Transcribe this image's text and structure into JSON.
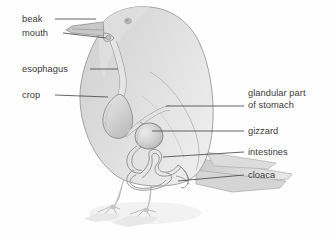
{
  "figure": {
    "colors": {
      "body_fill": "#d9d9d9",
      "body_fill_light": "#e4e4e4",
      "organ_fill": "#cfcfcf",
      "tract_stroke": "#8c8c8c",
      "outline": "#9a9a9a",
      "leader_line": "#4a4a4a",
      "text": "#3b3b3b",
      "background": "#fefefe",
      "shadow": "#eeeeee"
    }
  },
  "labels": {
    "left": [
      {
        "id": "beak",
        "text": "beak",
        "x": 22,
        "y": 14,
        "leader_x1": 55,
        "leader_y1": 19,
        "leader_x2": 96,
        "leader_y2": 19
      },
      {
        "id": "mouth",
        "text": "mouth",
        "x": 22,
        "y": 28,
        "leader_x1": 63,
        "leader_y1": 33,
        "leader_x2": 106,
        "leader_y2": 38
      },
      {
        "id": "esophagus",
        "text": "esophagus",
        "x": 22,
        "y": 64,
        "leader_x1": 90,
        "leader_y1": 69,
        "leader_x2": 118,
        "leader_y2": 69
      },
      {
        "id": "crop",
        "text": "crop",
        "x": 22,
        "y": 90,
        "leader_x1": 55,
        "leader_y1": 95,
        "leader_x2": 108,
        "leader_y2": 97
      }
    ],
    "right": [
      {
        "id": "glandular-part-of-stomach",
        "line1": "glandular part",
        "line2": "of stomach",
        "x": 248,
        "y": 88,
        "leader_x1": 166,
        "leader_y1": 106,
        "leader_x2": 244,
        "leader_y2": 106
      },
      {
        "id": "gizzard",
        "line1": "gizzard",
        "line2": "",
        "x": 248,
        "y": 126,
        "leader_x1": 152,
        "leader_y1": 131,
        "leader_x2": 244,
        "leader_y2": 131
      },
      {
        "id": "intestines",
        "line1": "intestines",
        "line2": "",
        "x": 248,
        "y": 147,
        "leader_x1": 163,
        "leader_y1": 157,
        "leader_x2": 244,
        "leader_y2": 152
      },
      {
        "id": "cloaca",
        "line1": "cloaca",
        "line2": "",
        "x": 248,
        "y": 170,
        "leader_x1": 178,
        "leader_y1": 181,
        "leader_x2": 244,
        "leader_y2": 175
      }
    ]
  }
}
